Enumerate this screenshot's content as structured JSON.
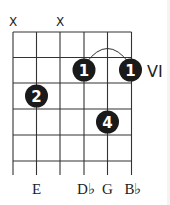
{
  "diagram": {
    "type": "guitar-chord",
    "strings": 6,
    "fret_label": "VI",
    "muted": [
      "X",
      "X"
    ],
    "muted_strings": [
      1,
      3
    ],
    "fingers": [
      {
        "label": "1",
        "string": 4,
        "fret": 2
      },
      {
        "label": "1",
        "string": 6,
        "fret": 2
      },
      {
        "label": "2",
        "string": 2,
        "fret": 3
      },
      {
        "label": "4",
        "string": 5,
        "fret": 4
      }
    ],
    "barre": {
      "from_string": 4,
      "to_string": 6,
      "fret": 2
    },
    "notes": [
      "",
      "E",
      "",
      "D♭",
      "G",
      "B♭"
    ],
    "colors": {
      "line": "#333333",
      "dot": "#1a1a1a",
      "dot_text": "#ffffff"
    }
  }
}
